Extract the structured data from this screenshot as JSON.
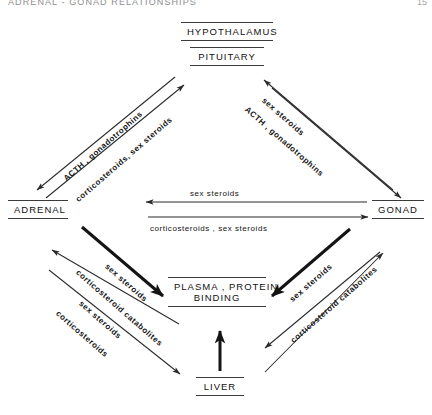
{
  "header": {
    "title": "ADRENAL - GONAD RELATIONSHIPS",
    "page": "15"
  },
  "nodes": {
    "hypothalamus": "HYPOTHALAMUS",
    "pituitary": "PITUITARY",
    "adrenal": "ADRENAL",
    "gonad": "GONAD",
    "plasma_line1": "PLASMA , PROTEIN",
    "plasma_line2": "BINDING",
    "liver": "LIVER"
  },
  "edge_labels": {
    "upper_left_down": "ACTH , gonadotrophins",
    "upper_left_up": "corticosteroids, sex steroids",
    "upper_right_up": "sex steroids",
    "upper_right_down": "ACTH , gonadotrophins",
    "middle_leftward": "sex steroids",
    "middle_rightward": "corticosteroids , sex steroids",
    "lower_left_bold": "sex steroids",
    "lower_left_out1": "corticosteroid catabolites",
    "lower_left_out2": "sex steroids",
    "lower_left_out3": "corticosteroids",
    "lower_right_bold": "sex steroids",
    "lower_right_out": "corticosteroid catabolites"
  },
  "colors": {
    "ink": "#141414",
    "rule": "#3b3b3b",
    "header": "#8e8e8e",
    "background": "#ffffff"
  },
  "diagram": {
    "type": "flow-diagram",
    "edges": [
      {
        "from": "PITUITARY",
        "to": "ADRENAL",
        "label": "ACTH , gonadotrophins",
        "weight": "thin"
      },
      {
        "from": "ADRENAL",
        "to": "PITUITARY",
        "label": "corticosteroids, sex steroids",
        "weight": "thin"
      },
      {
        "from": "GONAD",
        "to": "PITUITARY",
        "label": "sex steroids",
        "weight": "thin"
      },
      {
        "from": "PITUITARY",
        "to": "GONAD",
        "label": "ACTH , gonadotrophins",
        "weight": "thin"
      },
      {
        "from": "GONAD",
        "to": "ADRENAL",
        "label": "sex steroids",
        "weight": "thin"
      },
      {
        "from": "ADRENAL",
        "to": "GONAD",
        "label": "corticosteroids , sex steroids",
        "weight": "thin"
      },
      {
        "from": "ADRENAL",
        "to": "PLASMA , PROTEIN BINDING",
        "label": "sex steroids",
        "weight": "bold"
      },
      {
        "from": "PLASMA , PROTEIN BINDING",
        "to": "ADRENAL",
        "label": "corticosteroid catabolites",
        "weight": "thin"
      },
      {
        "from": "ADRENAL",
        "to": "LIVER",
        "label": "sex steroids / corticosteroids",
        "weight": "thin"
      },
      {
        "from": "GONAD",
        "to": "PLASMA , PROTEIN BINDING",
        "label": "sex steroids",
        "weight": "bold"
      },
      {
        "from": "PLASMA , PROTEIN BINDING",
        "to": "GONAD",
        "label": "corticosteroid catabolites",
        "weight": "thin"
      },
      {
        "from": "LIVER",
        "to": "PLASMA , PROTEIN BINDING",
        "label": "",
        "weight": "bold"
      }
    ]
  }
}
